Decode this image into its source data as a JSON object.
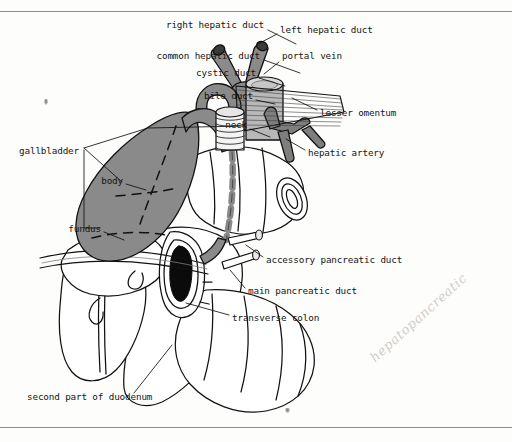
{
  "figure": {
    "background_color": "#fdfdfc",
    "ink_color": "#151515",
    "colors": {
      "biliary_duct_gray": "#8a8a8a",
      "gallbladder_gray": "#8a8a8a",
      "portal_vein_gray": "#b8b8b8",
      "hepatic_artery_gray": "#7e7e7e",
      "organ_white": "#ffffff",
      "lumen_black": "#0b0b0b",
      "rule_gray": "#8d8d8d",
      "handwriting_gray": "#cfcdc9"
    },
    "rules": [
      {
        "name": "top-rule",
        "y": 11
      },
      {
        "name": "bottom-rule",
        "y": 427
      }
    ],
    "annotation_handwriting": "hepatopancreatic",
    "specks": [
      {
        "name": "speck-upper-left",
        "x": 44,
        "y": 99
      },
      {
        "name": "speck-duodenum",
        "x": 285,
        "y": 408
      }
    ]
  },
  "labels": [
    {
      "id": "right-hepatic-duct",
      "text": "right hepatic duct",
      "x": 264,
      "y": 25,
      "align": "right",
      "leader": [
        [
          268,
          30
        ],
        [
          296,
          44
        ]
      ]
    },
    {
      "id": "left-hepatic-duct",
      "text": "left hepatic duct",
      "x": 280,
      "y": 30,
      "align": "left",
      "leader": [
        [
          277,
          34
        ],
        [
          258,
          44
        ]
      ]
    },
    {
      "id": "common-hepatic-duct",
      "text": "common hepatic duct",
      "x": 260,
      "y": 56,
      "align": "right",
      "leader": [
        [
          264,
          60
        ],
        [
          300,
          73
        ]
      ]
    },
    {
      "id": "portal-vein",
      "text": "portal vein",
      "x": 282,
      "y": 56,
      "align": "left",
      "leader": [
        [
          279,
          62
        ],
        [
          264,
          74
        ]
      ]
    },
    {
      "id": "cystic-duct",
      "text": "cystic duct",
      "x": 256,
      "y": 73,
      "align": "right",
      "leader": [
        [
          259,
          78
        ],
        [
          285,
          86
        ]
      ]
    },
    {
      "id": "bile-duct",
      "text": "bile duct",
      "x": 253,
      "y": 96,
      "align": "right",
      "leader": [
        [
          256,
          100
        ],
        [
          275,
          104
        ]
      ]
    },
    {
      "id": "lesser-omentum",
      "text": "lesser omentum",
      "x": 320,
      "y": 113,
      "align": "left",
      "leader": [
        [
          317,
          110
        ],
        [
          292,
          98
        ]
      ]
    },
    {
      "id": "neck",
      "text": "neck",
      "x": 247,
      "y": 125,
      "align": "right",
      "leader": [
        [
          250,
          129
        ],
        [
          270,
          137
        ]
      ]
    },
    {
      "id": "hepatic-artery",
      "text": "hepatic artery",
      "x": 308,
      "y": 153,
      "align": "left",
      "leader": [
        [
          305,
          150
        ],
        [
          286,
          139
        ]
      ]
    },
    {
      "id": "gallbladder",
      "text": "gallbladder",
      "x": 79,
      "y": 151,
      "align": "right"
    },
    {
      "id": "body",
      "text": "body",
      "x": 123,
      "y": 181,
      "align": "right",
      "leader": [
        [
          126,
          184
        ],
        [
          146,
          190
        ]
      ]
    },
    {
      "id": "fundus",
      "text": "fundus",
      "x": 101,
      "y": 229,
      "align": "right",
      "leader": [
        [
          104,
          232
        ],
        [
          124,
          240
        ]
      ]
    },
    {
      "id": "accessory-pancreatic-duct",
      "text": "accessory pancreatic duct",
      "x": 266,
      "y": 260,
      "align": "left",
      "leader": [
        [
          263,
          257
        ],
        [
          246,
          245
        ]
      ]
    },
    {
      "id": "main-pancreatic-duct",
      "text": "main pancreatic duct",
      "x": 248,
      "y": 291,
      "align": "left",
      "leader": [
        [
          245,
          288
        ],
        [
          230,
          270
        ]
      ]
    },
    {
      "id": "transverse-colon",
      "text": "transverse colon",
      "x": 232,
      "y": 318,
      "align": "left",
      "leader": [
        [
          229,
          315
        ],
        [
          186,
          303
        ]
      ]
    },
    {
      "id": "second-part-of-duodenum",
      "text": "second part of duodenum",
      "x": 27,
      "y": 397,
      "align": "left",
      "leader": [
        [
          134,
          393
        ],
        [
          172,
          345
        ]
      ]
    }
  ],
  "anatomy_parts": [
    "right hepatic duct",
    "left hepatic duct",
    "common hepatic duct",
    "cystic duct",
    "bile duct",
    "portal vein",
    "hepatic artery",
    "lesser omentum",
    "gallbladder neck",
    "gallbladder body",
    "gallbladder fundus",
    "accessory pancreatic duct",
    "main pancreatic duct",
    "transverse colon",
    "second part of duodenum"
  ]
}
